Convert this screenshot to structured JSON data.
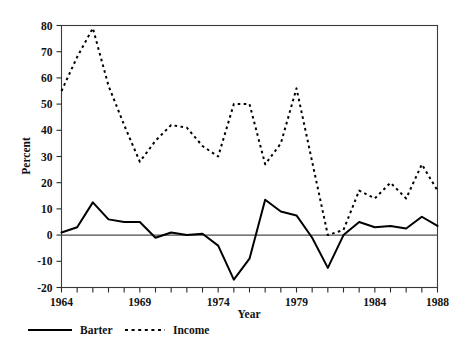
{
  "chart_data": {
    "type": "line",
    "title": "",
    "xlabel": "Year",
    "ylabel": "Percent",
    "xlim": [
      1964,
      1988
    ],
    "ylim": [
      -20,
      80
    ],
    "yticks": [
      -20,
      -10,
      0,
      10,
      20,
      30,
      40,
      50,
      60,
      70,
      80
    ],
    "ytick_labels": [
      "-20",
      "-10",
      "0",
      "10",
      "20",
      "30",
      "40",
      "50",
      "60",
      "70",
      "80"
    ],
    "xticks": [
      1964,
      1965,
      1966,
      1967,
      1968,
      1969,
      1970,
      1971,
      1972,
      1973,
      1974,
      1975,
      1976,
      1977,
      1978,
      1979,
      1980,
      1981,
      1982,
      1983,
      1984,
      1985,
      1986,
      1987,
      1988
    ],
    "xtick_labels_shown": [
      "1964",
      "1969",
      "1974",
      "1979",
      "1984",
      "1988"
    ],
    "xtick_labels_positions": [
      1964,
      1969,
      1974,
      1979,
      1984,
      1988
    ],
    "grid": false,
    "zero_reference_line": 0,
    "legend_position": "below-left",
    "x": [
      1964,
      1965,
      1966,
      1967,
      1968,
      1969,
      1970,
      1971,
      1972,
      1973,
      1974,
      1975,
      1976,
      1977,
      1978,
      1979,
      1980,
      1981,
      1982,
      1983,
      1984,
      1985,
      1986,
      1987,
      1988
    ],
    "series": [
      {
        "name": "Barter",
        "style": "solid",
        "color": "#000000",
        "values": [
          1,
          3,
          12.5,
          6,
          5,
          5,
          -1,
          1,
          0,
          0.5,
          -4,
          -17,
          -9,
          13.5,
          9,
          7.5,
          -1,
          -12.5,
          0,
          5,
          3,
          3.5,
          2.5,
          7,
          3.5
        ]
      },
      {
        "name": "Income",
        "style": "dashed",
        "color": "#000000",
        "values": [
          55,
          68,
          79,
          57,
          42,
          28,
          36,
          42,
          41,
          34,
          30,
          50,
          50,
          27,
          35,
          56,
          28,
          0,
          2,
          17,
          14,
          20,
          14,
          27,
          17
        ]
      }
    ],
    "legend": [
      {
        "label": "Barter",
        "style": "solid"
      },
      {
        "label": "Income",
        "style": "dashed"
      }
    ]
  }
}
